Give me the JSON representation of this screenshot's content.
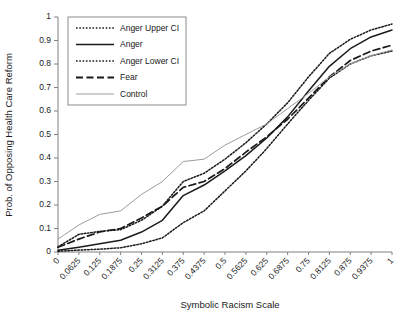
{
  "chart_data": {
    "type": "line",
    "title": "",
    "xlabel": "Symbolic Racism Scale",
    "ylabel": "Prob. of Opposing Health Care Reform",
    "xlim": [
      0,
      1
    ],
    "ylim": [
      0,
      1
    ],
    "grid": false,
    "legend_position": "top-left",
    "x": [
      0,
      0.0625,
      0.125,
      0.1875,
      0.25,
      0.3125,
      0.375,
      0.4375,
      0.5,
      0.5625,
      0.625,
      0.6875,
      0.75,
      0.8125,
      0.875,
      0.9375,
      1
    ],
    "xtick_labels": [
      "0",
      "0.0625",
      "0.125",
      "0.1875",
      "0.25",
      "0.3125",
      "0.375",
      "0.4375",
      "0.5",
      "0.5625",
      "0.625",
      "0.6875",
      "0.75",
      "0.8125",
      "0.875",
      "0.9375",
      "1"
    ],
    "ytick_labels": [
      "0",
      "0.1",
      "0.2",
      "0.3",
      "0.4",
      "0.5",
      "0.6",
      "0.7",
      "0.8",
      "0.9",
      "1"
    ],
    "ytick_values": [
      0,
      0.1,
      0.2,
      0.3,
      0.4,
      0.5,
      0.6,
      0.7,
      0.8,
      0.9,
      1
    ],
    "series": [
      {
        "name": "Anger Upper CI",
        "style": "dotted",
        "color": "#1a1a1a",
        "values": [
          0.022,
          0.075,
          0.088,
          0.095,
          0.135,
          0.195,
          0.3,
          0.335,
          0.395,
          0.465,
          0.545,
          0.635,
          0.745,
          0.845,
          0.905,
          0.945,
          0.97
        ]
      },
      {
        "name": "Anger",
        "style": "solid",
        "color": "#1a1a1a",
        "values": [
          0.007,
          0.02,
          0.035,
          0.05,
          0.085,
          0.135,
          0.24,
          0.285,
          0.345,
          0.41,
          0.485,
          0.575,
          0.685,
          0.79,
          0.865,
          0.915,
          0.945
        ]
      },
      {
        "name": "Anger Lower CI",
        "style": "dotted",
        "color": "#1a1a1a",
        "values": [
          0.003,
          0.008,
          0.012,
          0.018,
          0.035,
          0.06,
          0.125,
          0.175,
          0.26,
          0.345,
          0.44,
          0.545,
          0.645,
          0.74,
          0.8,
          0.835,
          0.855
        ]
      },
      {
        "name": "Fear",
        "style": "dashed",
        "color": "#1a1a1a",
        "values": [
          0.02,
          0.055,
          0.085,
          0.1,
          0.145,
          0.195,
          0.275,
          0.3,
          0.355,
          0.425,
          0.49,
          0.565,
          0.655,
          0.745,
          0.815,
          0.855,
          0.88
        ]
      },
      {
        "name": "Control",
        "style": "solid-light",
        "color": "#9c9c9c",
        "values": [
          0.055,
          0.115,
          0.16,
          0.175,
          0.245,
          0.3,
          0.385,
          0.395,
          0.455,
          0.5,
          0.545,
          0.61,
          0.675,
          0.745,
          0.8,
          0.835,
          0.86
        ]
      }
    ]
  }
}
